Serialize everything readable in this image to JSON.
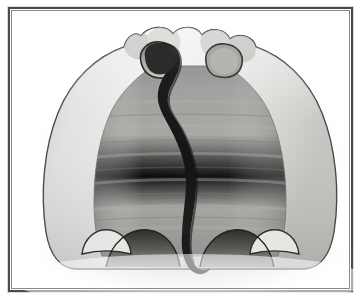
{
  "image": {
    "kind": "grayscale-anatomical-illustration",
    "subject": "dome shaped sectional anatomy with central sinuous dark channel",
    "background_color": "#ffffff",
    "orientation": "portrait-crop",
    "width_px": 363,
    "height_px": 306
  },
  "frame": {
    "name": "rectangular-picture-frame",
    "outer_color": "#4a4a4c",
    "inner_color": "#8a8a8d",
    "fill_color": "#ffffff",
    "border_width_px": 2,
    "x": 8,
    "y": 7,
    "width": 345,
    "height": 285
  },
  "palette": {
    "paper_white": "#ffffff",
    "outline_dark": "#2b2b2b",
    "shell_light": "#e8e8e6",
    "shell_mid": "#d2d2cf",
    "shell_shadow": "#b5b5b2",
    "cavity_mid_gray": "#9a9a98",
    "cavity_dark_gray": "#8a8a88",
    "cavity_band_light": "#a8a8a5",
    "channel_black": "#1a1a1a",
    "channel_dark": "#2f2f2f",
    "lobe_gray": "#9d9d9b",
    "scallop_dark": "#3a3a38",
    "haze_gray": "#cfcfcc"
  },
  "regions": [
    {
      "id": "outer-shell",
      "label": "Outer dome shell",
      "tone": "light gray",
      "color": "#dddddb",
      "description": "Broad light-toned dome forming the outer body wall, darkest along its thin outline edge."
    },
    {
      "id": "inner-cavity",
      "label": "Inner cavity field",
      "tone": "medium gray",
      "color": "#9a9a98",
      "description": "Large mid-gray interior area filling the dome, with faint horizontal banding striations."
    },
    {
      "id": "central-channel",
      "label": "Central sinuous channel",
      "tone": "near black",
      "color": "#1a1a1a",
      "description": "Dark S-curved band descending from the upper-left opening to the bottom center, widest at mid height and tapering to a thin hook at the base."
    },
    {
      "id": "left-opening",
      "label": "Left upper opening",
      "tone": "dark",
      "color": "#33332f",
      "description": "Oval aperture at the top-left lobe where the dark channel originates."
    },
    {
      "id": "right-opening",
      "label": "Right upper opening",
      "tone": "medium gray",
      "color": "#9d9d9b",
      "description": "Smaller oval aperture at the top-right lobe, outlined in dark gray."
    },
    {
      "id": "top-lobes",
      "label": "Top lobes",
      "tone": "light gray",
      "count": 5,
      "color": "#dcdcda",
      "description": "Row of rounded bumps cresting the top of the dome."
    },
    {
      "id": "bottom-scallops",
      "label": "Bottom scalloped arches",
      "tone": "dark gradient",
      "count": 4,
      "color": "#3a3a38",
      "description": "Scalloped lower border with two large dark arches flanking the channel base and two pale notches at the outer edges."
    },
    {
      "id": "basal-haze",
      "label": "Basal haze",
      "tone": "soft gray",
      "color": "#cfcfcc",
      "description": "Diffuse gray haze spreading outward along the bottom, fading into the white background."
    }
  ],
  "striations": {
    "label": "Horizontal banding",
    "count": 7,
    "color": "#a6a6a3",
    "description": "Faint light horizontal bands crossing the inner cavity."
  },
  "annotations": {
    "has_text_labels": false,
    "has_scale_bar": false,
    "has_legend": false,
    "visible_text": ""
  }
}
